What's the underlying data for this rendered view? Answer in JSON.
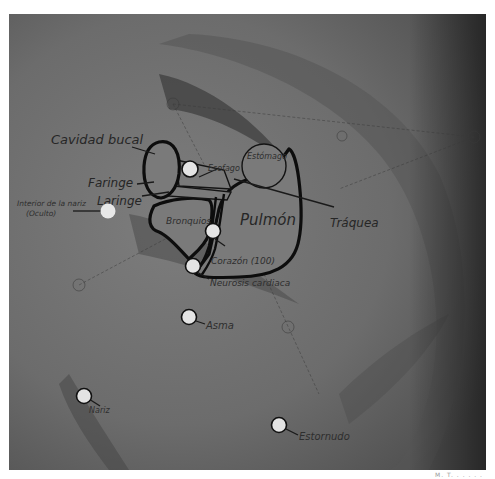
{
  "diagram": {
    "organs": [
      {
        "id": "cavidad-bucal",
        "label": "Cavidad bucal"
      },
      {
        "id": "faringe",
        "label": "Faringe"
      },
      {
        "id": "laringe",
        "label": "Laringe"
      },
      {
        "id": "esofago",
        "label": "Esofago"
      },
      {
        "id": "estomago",
        "label": "Estómago"
      },
      {
        "id": "bronquios",
        "label": "Bronquios"
      },
      {
        "id": "pulmon",
        "label": "Pulmón"
      },
      {
        "id": "traquea",
        "label": "Tráquea"
      }
    ],
    "points": [
      {
        "id": "interior-nariz",
        "label_line1": "Interior de la nariz",
        "label_line2": "(Oculto)"
      },
      {
        "id": "corazon",
        "label": "Corazón (100)"
      },
      {
        "id": "neurosis-cardiaca",
        "label": "Neurosis cardiaca"
      },
      {
        "id": "asma",
        "label": "Asma"
      },
      {
        "id": "nariz",
        "label": "Nariz"
      },
      {
        "id": "estornudo",
        "label": "Estornudo"
      }
    ],
    "colors": {
      "background_skin": "#6e6e6e",
      "organ_fill": "#7a7a7a",
      "outline": "#0d0d0d",
      "point_fill": "#e4e4e4",
      "label_text": "#262626"
    }
  },
  "footer": {
    "caption": "M. T.  .  .  .  .  ."
  }
}
